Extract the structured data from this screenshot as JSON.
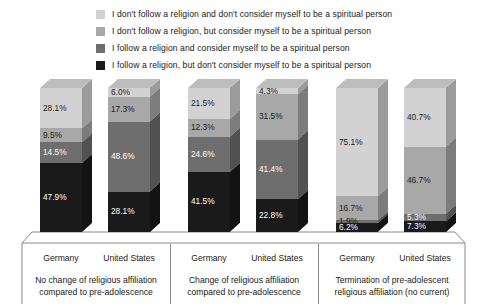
{
  "legend": {
    "items": [
      {
        "label": "I don't follow a religion and don't consider myself to be a spiritual person",
        "color": "#d2d2d2",
        "key": "no_religion_not_spiritual"
      },
      {
        "label": "I don't follow a religion, but consider myself to be a spiritual person",
        "color": "#a8a8a8",
        "key": "no_religion_spiritual"
      },
      {
        "label": "I follow a religion and consider myself to be a spiritual person",
        "color": "#6e6e6e",
        "key": "religion_spiritual"
      },
      {
        "label": "I follow a religion, but don't consider myself to be a spiritual person",
        "color": "#1a1a1a",
        "key": "religion_not_spiritual"
      }
    ]
  },
  "chart_data": {
    "type": "bar",
    "subtype": "stacked-100-percent-3d",
    "title": "",
    "xlabel": "",
    "ylabel": "",
    "ylim": [
      0,
      100
    ],
    "grid": false,
    "legend_position": "top",
    "value_suffix": "%",
    "series": [
      {
        "name": "I don't follow a religion and don't consider myself to be a spiritual person",
        "color": "#d2d2d2",
        "values": [
          28.1,
          6.0,
          21.5,
          4.3,
          75.1,
          40.7
        ]
      },
      {
        "name": "I don't follow a religion, but consider myself to be a spiritual person",
        "color": "#a8a8a8",
        "values": [
          9.5,
          17.3,
          12.3,
          31.5,
          16.7,
          46.7
        ]
      },
      {
        "name": "I follow a religion and consider myself to be a spiritual person",
        "color": "#6e6e6e",
        "values": [
          14.5,
          48.6,
          24.6,
          41.4,
          1.9,
          5.3
        ]
      },
      {
        "name": "I follow a religion, but don't consider myself to be a spiritual person",
        "color": "#1a1a1a",
        "values": [
          47.9,
          28.1,
          41.5,
          22.8,
          6.2,
          7.3
        ]
      }
    ],
    "categories": [
      "Germany",
      "United States",
      "Germany",
      "United States",
      "Germany",
      "United States"
    ],
    "bars": [
      {
        "country": "Germany",
        "group": "No change of religious affiliation compared to pre-adolescence",
        "segments": [
          {
            "label": "28.1%",
            "value": 28.1,
            "color": "#d2d2d2",
            "text_color": "#1a1a1a"
          },
          {
            "label": "9.5%",
            "value": 9.5,
            "color": "#a8a8a8",
            "text_color": "#1a1a1a"
          },
          {
            "label": "14.5%",
            "value": 14.5,
            "color": "#6e6e6e",
            "text_color": "#ffffff"
          },
          {
            "label": "47.9%",
            "value": 47.9,
            "color": "#1a1a1a",
            "text_color": "#ffffff"
          }
        ]
      },
      {
        "country": "United States",
        "group": "No change of religious affiliation compared to pre-adolescence",
        "segments": [
          {
            "label": "6.0%",
            "value": 6.0,
            "color": "#d2d2d2",
            "text_color": "#1a1a1a"
          },
          {
            "label": "17.3%",
            "value": 17.3,
            "color": "#a8a8a8",
            "text_color": "#1a1a1a"
          },
          {
            "label": "48.6%",
            "value": 48.6,
            "color": "#6e6e6e",
            "text_color": "#ffffff"
          },
          {
            "label": "28.1%",
            "value": 28.1,
            "color": "#1a1a1a",
            "text_color": "#ffffff"
          }
        ]
      },
      {
        "country": "Germany",
        "group": "Change of religious affiliation compared to pre-adolescence",
        "segments": [
          {
            "label": "21.5%",
            "value": 21.5,
            "color": "#d2d2d2",
            "text_color": "#1a1a1a"
          },
          {
            "label": "12.3%",
            "value": 12.3,
            "color": "#a8a8a8",
            "text_color": "#1a1a1a"
          },
          {
            "label": "24.6%",
            "value": 24.6,
            "color": "#6e6e6e",
            "text_color": "#ffffff"
          },
          {
            "label": "41.5%",
            "value": 41.5,
            "color": "#1a1a1a",
            "text_color": "#ffffff"
          }
        ]
      },
      {
        "country": "United States",
        "group": "Change of religious affiliation compared to pre-adolescence",
        "segments": [
          {
            "label": "4.3%",
            "value": 4.3,
            "color": "#d2d2d2",
            "text_color": "#1a1a1a"
          },
          {
            "label": "31.5%",
            "value": 31.5,
            "color": "#a8a8a8",
            "text_color": "#1a1a1a"
          },
          {
            "label": "41.4%",
            "value": 41.4,
            "color": "#6e6e6e",
            "text_color": "#ffffff"
          },
          {
            "label": "22.8%",
            "value": 22.8,
            "color": "#1a1a1a",
            "text_color": "#ffffff"
          }
        ]
      },
      {
        "country": "Germany",
        "group": "Termination of pre-adolescent religious affiliation (no current)",
        "segments": [
          {
            "label": "75.1%",
            "value": 75.1,
            "color": "#d2d2d2",
            "text_color": "#1a1a1a"
          },
          {
            "label": "16.7%",
            "value": 16.7,
            "color": "#a8a8a8",
            "text_color": "#1a1a1a"
          },
          {
            "label": "1.9%",
            "value": 1.9,
            "color": "#6e6e6e",
            "text_color": "#1a1a1a"
          },
          {
            "label": "6.2%",
            "value": 6.2,
            "color": "#1a1a1a",
            "text_color": "#ffffff"
          }
        ]
      },
      {
        "country": "United States",
        "group": "Termination of pre-adolescent religious affiliation (no current)",
        "segments": [
          {
            "label": "40.7%",
            "value": 40.7,
            "color": "#d2d2d2",
            "text_color": "#1a1a1a"
          },
          {
            "label": "46.7%",
            "value": 46.7,
            "color": "#a8a8a8",
            "text_color": "#1a1a1a"
          },
          {
            "label": "5.3%",
            "value": 5.3,
            "color": "#6e6e6e",
            "text_color": "#ffffff"
          },
          {
            "label": "7.3%",
            "value": 7.3,
            "color": "#1a1a1a",
            "text_color": "#ffffff"
          }
        ]
      }
    ],
    "groups": [
      {
        "line1": "No change of religious affiliation",
        "line2": "compared to pre-adolescence"
      },
      {
        "line1": "Change of religious affiliation",
        "line2": "compared to pre-adolescence"
      },
      {
        "line1": "Termination of pre-adolescent",
        "line2": "religious affiliation (no current)"
      }
    ]
  }
}
